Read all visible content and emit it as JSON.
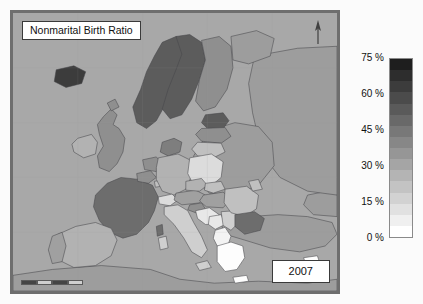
{
  "map": {
    "title": "Nonmarital Birth Ratio",
    "year": "2007",
    "north_arrow_icon": "north-arrow-icon",
    "scale_bar_icon": "scale-bar-icon",
    "ocean_color": "#a8a8a8",
    "frame_color": "#6e6e6e",
    "border_color": "#3a3a3a"
  },
  "legend": {
    "unit": "%",
    "ticks": [
      "75 %",
      "60 %",
      "45 %",
      "30 %",
      "15 %",
      "0 %"
    ],
    "band_count": 16,
    "low_color": "#ffffff",
    "high_color": "#1e1e1e"
  },
  "chart_data": {
    "type": "heatmap",
    "title": "Nonmarital Birth Ratio",
    "subtitle": "2007",
    "xlabel": "",
    "ylabel": "",
    "legend_position": "right",
    "grid": false,
    "colorbar": {
      "label": "Nonmarital Birth Ratio (%)",
      "min": 0,
      "max": 75,
      "tick_values": [
        0,
        15,
        30,
        45,
        60,
        75
      ],
      "tick_labels": [
        "0 %",
        "15 %",
        "30 %",
        "45 %",
        "60 %",
        "75 %"
      ],
      "bands": 16,
      "scheme": "grayscale-light-to-dark"
    },
    "categories": [
      "Iceland",
      "Norway",
      "Sweden",
      "Finland",
      "Estonia",
      "Denmark",
      "France",
      "Bulgaria",
      "Slovenia",
      "United Kingdom",
      "Latvia",
      "Belgium",
      "Netherlands",
      "Portugal",
      "Austria",
      "Hungary",
      "Ireland",
      "Czech Republic",
      "Spain",
      "Germany",
      "Slovakia",
      "Romania",
      "Lithuania",
      "Luxembourg",
      "Poland",
      "Italy",
      "Switzerland",
      "Croatia",
      "Greece",
      "Cyprus"
    ],
    "values": [
      66,
      55,
      55,
      41,
      58,
      46,
      51,
      51,
      45,
      44,
      43,
      42,
      40,
      36,
      38,
      38,
      33,
      35,
      30,
      30,
      29,
      27,
      28,
      27,
      20,
      21,
      17,
      13,
      6,
      5
    ]
  }
}
